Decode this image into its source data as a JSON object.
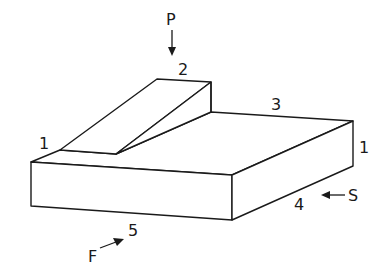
{
  "diagram": {
    "type": "isometric-block-with-ramp",
    "colors": {
      "line": "#1a1a1a",
      "background": "#ffffff"
    },
    "labels": {
      "P": "P",
      "F": "F",
      "S": "S",
      "edge_1_left": "1",
      "edge_1_right": "1",
      "edge_2": "2",
      "edge_3": "3",
      "edge_4": "4",
      "edge_5": "5"
    },
    "arrows": [
      {
        "name": "P",
        "direction": "down"
      },
      {
        "name": "S",
        "direction": "left"
      },
      {
        "name": "F",
        "direction": "up-right"
      }
    ]
  }
}
